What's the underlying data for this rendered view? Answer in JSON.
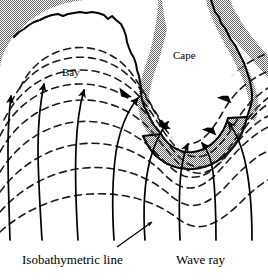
{
  "figure": {
    "labels": {
      "bay": "Bay",
      "cape": "Cape",
      "isobath_legend": "Isobathymetric line",
      "wave_ray_legend": "Wave ray"
    },
    "colors": {
      "land_fill": "#a8a8a8",
      "shoreline": "#000000",
      "isobath": "#1a1a1a",
      "wave_ray": "#000000",
      "background": "#ffffff",
      "text": "#000000"
    },
    "legend_items": [
      {
        "name": "isobath",
        "label": "Isobathymetric line",
        "style": "dashed"
      },
      {
        "name": "wave-ray",
        "label": "Wave ray",
        "style": "solid-with-arrowhead"
      }
    ],
    "features": [
      {
        "name": "bay",
        "label": "Bay",
        "description": "broad concave embayment on the left where wave rays diverge"
      },
      {
        "name": "cape",
        "label": "Cape",
        "description": "headland on the right where wave rays converge"
      }
    ],
    "counts": {
      "isobaths": 9,
      "wave_rays": 8,
      "ray_arrowheads": 10
    }
  }
}
